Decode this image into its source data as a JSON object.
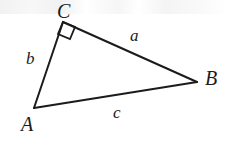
{
  "figure": {
    "kind": "geometry-diagram",
    "width": 227,
    "height": 145,
    "background_color": "#ffffff",
    "stroke_color": "#1b1b1b",
    "stroke_width": 2,
    "vertices": [
      {
        "id": "A",
        "label": "A",
        "x": 34,
        "y": 108,
        "label_x": 21,
        "label_y": 114
      },
      {
        "id": "B",
        "label": "B",
        "x": 197,
        "y": 82,
        "label_x": 205,
        "label_y": 68
      },
      {
        "id": "C",
        "label": "C",
        "x": 63,
        "y": 22,
        "label_x": 57,
        "label_y": 1
      }
    ],
    "sides": [
      {
        "id": "a",
        "label": "a",
        "from": "C",
        "to": "B",
        "label_x": 130,
        "label_y": 27
      },
      {
        "id": "b",
        "label": "b",
        "from": "A",
        "to": "C",
        "label_x": 26,
        "label_y": 50
      },
      {
        "id": "c",
        "label": "c",
        "from": "A",
        "to": "B",
        "label_x": 113,
        "label_y": 104
      }
    ],
    "right_angle": {
      "at_vertex": "C",
      "marker": "square",
      "size": 13,
      "points": "63,22 75,27 70,39 58,34"
    }
  }
}
